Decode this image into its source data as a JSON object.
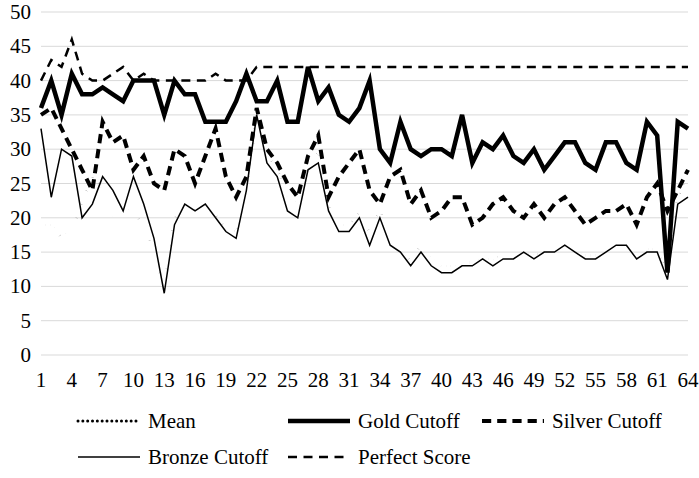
{
  "chart_data": {
    "type": "line",
    "title": "",
    "xlabel": "",
    "ylabel": "",
    "xlim": [
      1,
      64
    ],
    "ylim": [
      0,
      50
    ],
    "grid": true,
    "legend_position": "bottom",
    "x": [
      1,
      2,
      3,
      4,
      5,
      6,
      7,
      8,
      9,
      10,
      11,
      12,
      13,
      14,
      15,
      16,
      17,
      18,
      19,
      20,
      21,
      22,
      23,
      24,
      25,
      26,
      27,
      28,
      29,
      30,
      31,
      32,
      33,
      34,
      35,
      36,
      37,
      38,
      39,
      40,
      41,
      42,
      43,
      44,
      45,
      46,
      47,
      48,
      49,
      50,
      51,
      52,
      53,
      54,
      55,
      56,
      57,
      58,
      59,
      60,
      61,
      62,
      63,
      64
    ],
    "x_tick_labels": [
      "1",
      "4",
      "7",
      "10",
      "13",
      "16",
      "19",
      "22",
      "25",
      "28",
      "31",
      "34",
      "37",
      "40",
      "43",
      "46",
      "49",
      "52",
      "55",
      "58",
      "61",
      "64"
    ],
    "x_tick_values": [
      1,
      4,
      7,
      10,
      13,
      16,
      19,
      22,
      25,
      28,
      31,
      34,
      37,
      40,
      43,
      46,
      49,
      52,
      55,
      58,
      61,
      64
    ],
    "y_tick_labels": [
      "0",
      "5",
      "10",
      "15",
      "20",
      "25",
      "30",
      "35",
      "40",
      "45",
      "50"
    ],
    "y_tick_values": [
      0,
      5,
      10,
      15,
      20,
      25,
      30,
      35,
      40,
      45,
      50
    ],
    "series": [
      {
        "name": "Mean",
        "style": "dotted",
        "width": 3,
        "values": [
          19,
          19,
          17,
          18.5,
          22,
          26,
          24,
          20,
          21.5,
          21,
          18.5,
          15,
          9.5,
          20,
          22,
          21,
          23,
          20.5,
          18.5,
          18,
          24,
          35,
          29.5,
          27,
          23,
          22,
          27.5,
          29.5,
          22,
          19,
          19,
          21,
          18,
          21,
          17,
          15.5,
          13.5,
          16,
          14,
          13,
          13,
          13.5,
          13.5,
          14,
          14,
          14.5,
          14,
          15,
          14.5,
          15,
          15,
          16,
          15,
          14.5,
          14.5,
          15,
          16,
          16,
          15,
          15.5,
          15.5,
          12,
          23,
          26
        ]
      },
      {
        "name": "Gold Cutoff",
        "style": "solid-thick",
        "width": 4.5,
        "values": [
          36,
          40,
          35,
          41,
          38,
          38,
          39,
          38,
          37,
          40,
          40,
          40,
          35,
          40,
          38,
          38,
          34,
          34,
          34,
          37,
          41,
          37,
          37,
          40,
          34,
          34,
          42,
          37,
          39,
          35,
          34,
          36,
          40,
          30,
          28,
          34,
          30,
          29,
          30,
          30,
          29,
          35,
          28,
          31,
          30,
          32,
          29,
          28,
          30,
          27,
          29,
          31,
          31,
          28,
          27,
          31,
          31,
          28,
          27,
          34,
          32,
          12,
          34,
          33
        ]
      },
      {
        "name": "Silver Cutoff",
        "style": "dashed-thick",
        "width": 4,
        "values": [
          35,
          36,
          33,
          30,
          27,
          24,
          34,
          31,
          32,
          27,
          29,
          25,
          24,
          30,
          29,
          25,
          29,
          33,
          26,
          23,
          26,
          36,
          30,
          28,
          25,
          23,
          29,
          32,
          23,
          26,
          28,
          30,
          24,
          22,
          26,
          27,
          22,
          24,
          20,
          21,
          23,
          23,
          19,
          20,
          22,
          23,
          21,
          20,
          22,
          20,
          22,
          23,
          21,
          19,
          20,
          21,
          21,
          22,
          19,
          23,
          25,
          21,
          24,
          27
        ]
      },
      {
        "name": "Bronze Cutoff",
        "style": "solid-thin",
        "width": 1.5,
        "values": [
          33,
          23,
          30,
          29,
          20,
          22,
          26,
          24,
          21,
          26,
          22,
          17,
          9,
          19,
          22,
          21,
          22,
          20,
          18,
          17,
          24,
          35,
          28,
          26,
          21,
          20,
          27,
          28,
          21,
          18,
          18,
          20,
          16,
          20,
          16,
          15,
          13,
          15,
          13,
          12,
          12,
          13,
          13,
          14,
          13,
          14,
          14,
          15,
          14,
          15,
          15,
          16,
          15,
          14,
          14,
          15,
          16,
          16,
          14,
          15,
          15,
          11,
          22,
          23
        ]
      },
      {
        "name": "Perfect Score",
        "style": "dashed-thin",
        "width": 2.5,
        "values": [
          40,
          43,
          42,
          46,
          41,
          40,
          40,
          41,
          42,
          40,
          41,
          40,
          40,
          40,
          40,
          40,
          40,
          41,
          40,
          40,
          40,
          42,
          42,
          42,
          42,
          42,
          42,
          42,
          42,
          42,
          42,
          42,
          42,
          42,
          42,
          42,
          42,
          42,
          42,
          42,
          42,
          42,
          42,
          42,
          42,
          42,
          42,
          42,
          42,
          42,
          42,
          42,
          42,
          42,
          42,
          42,
          42,
          42,
          42,
          42,
          42,
          42,
          42,
          42
        ]
      }
    ]
  },
  "legend": {
    "entries": [
      {
        "label": "Mean",
        "style": "dotted"
      },
      {
        "label": "Gold Cutoff",
        "style": "solid-thick"
      },
      {
        "label": "Silver Cutoff",
        "style": "dashed-thick"
      },
      {
        "label": "Bronze Cutoff",
        "style": "solid-thin"
      },
      {
        "label": "Perfect Score",
        "style": "dashed-thin"
      }
    ]
  },
  "colors": {
    "series": "#000000",
    "grid": "#d9d9d9",
    "background": "#ffffff"
  }
}
